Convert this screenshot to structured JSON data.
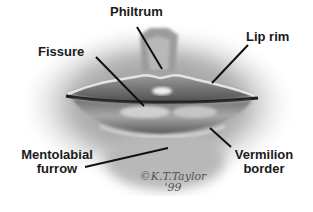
{
  "diagram": {
    "labels": {
      "philtrum": "Philtrum",
      "lip_rim": "Lip rim",
      "fissure": "Fissure",
      "mentolabial_line1": "Mentolabial",
      "mentolabial_line2": "furrow",
      "vermilion_line1": "Vermilion",
      "vermilion_line2": "border"
    },
    "signature": {
      "name": "©K.T.Taylor",
      "year": "'99"
    }
  }
}
